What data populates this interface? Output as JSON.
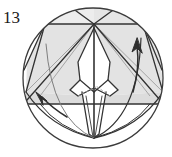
{
  "figure": {
    "kind": "origami-step-diagram",
    "step_label": "13",
    "canvas": {
      "width": 172,
      "height": 157
    },
    "colors": {
      "outline": "#3b3b3b",
      "crease_dark": "#2e2e2e",
      "crease_light": "#8e8e8e",
      "shade_fill": "#e3e3e3",
      "shade_fill_dark": "#d8d8d8",
      "paper_white": "#ffffff",
      "label_text": "#1a1a1a",
      "arrow": "#2e2e2e",
      "dashed_crease": "#9a9a9a"
    },
    "circle": {
      "cx": 93,
      "cy": 78,
      "r": 70,
      "stroke_width": 1.3
    },
    "key_points": {
      "top_apex": {
        "x": 94,
        "y": 24
      },
      "bottom_apex": {
        "x": 94,
        "y": 138
      },
      "upper_band_y": 24,
      "lower_band_y": 104,
      "left_edge_x": 24,
      "right_edge_x": 163
    },
    "arrows": [
      {
        "name": "right-up-arrow",
        "direction": "up",
        "from": {
          "x": 133,
          "y": 92
        },
        "to": {
          "x": 137,
          "y": 42
        }
      },
      {
        "name": "left-up-left-arrow",
        "direction": "up-left",
        "from": {
          "x": 67,
          "y": 117
        },
        "to": {
          "x": 39,
          "y": 94
        }
      }
    ],
    "shaded_panels": [
      {
        "name": "upper-left-panel"
      },
      {
        "name": "upper-right-panel"
      },
      {
        "name": "lower-left-panel"
      },
      {
        "name": "lower-right-panel"
      }
    ],
    "white_shapes": [
      {
        "name": "central-kite"
      },
      {
        "name": "lower-spike"
      }
    ]
  }
}
